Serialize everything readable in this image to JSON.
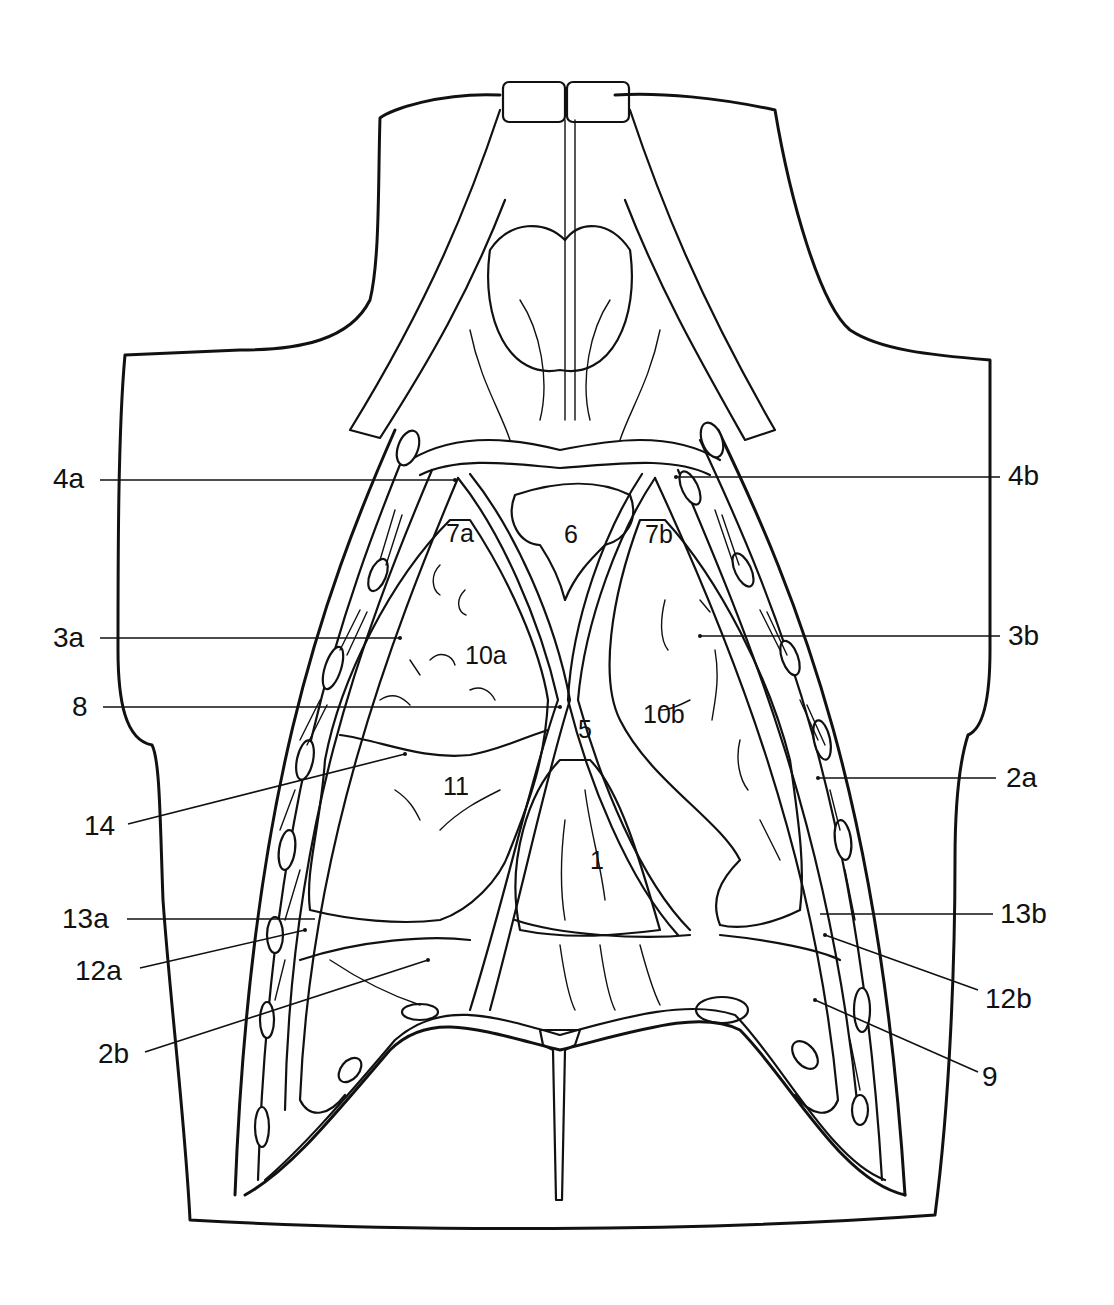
{
  "figure": {
    "type": "anatomical line drawing",
    "background": "#ffffff",
    "ink": "#111111"
  },
  "labels": {
    "outer": [
      {
        "id": "4a",
        "text": "4a",
        "side": "left"
      },
      {
        "id": "3a",
        "text": "3a",
        "side": "left"
      },
      {
        "id": "8",
        "text": "8",
        "side": "left"
      },
      {
        "id": "14",
        "text": "14",
        "side": "left"
      },
      {
        "id": "13a",
        "text": "13a",
        "side": "left"
      },
      {
        "id": "12a",
        "text": "12a",
        "side": "left"
      },
      {
        "id": "2b",
        "text": "2b",
        "side": "left"
      },
      {
        "id": "4b",
        "text": "4b",
        "side": "right"
      },
      {
        "id": "3b",
        "text": "3b",
        "side": "right"
      },
      {
        "id": "2a",
        "text": "2a",
        "side": "right"
      },
      {
        "id": "13b",
        "text": "13b",
        "side": "right"
      },
      {
        "id": "12b",
        "text": "12b",
        "side": "right"
      },
      {
        "id": "9",
        "text": "9",
        "side": "right"
      }
    ],
    "inner": [
      {
        "id": "7a",
        "text": "7a"
      },
      {
        "id": "6",
        "text": "6"
      },
      {
        "id": "7b",
        "text": "7b"
      },
      {
        "id": "10a",
        "text": "10a"
      },
      {
        "id": "10b",
        "text": "10b"
      },
      {
        "id": "5",
        "text": "5"
      },
      {
        "id": "11",
        "text": "11"
      },
      {
        "id": "1",
        "text": "1"
      }
    ]
  }
}
